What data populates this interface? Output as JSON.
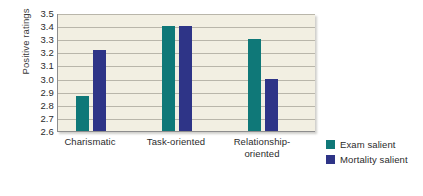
{
  "chart_data": {
    "type": "bar",
    "title": "",
    "xlabel": "",
    "ylabel": "Positive ratings",
    "ylim": [
      2.6,
      3.5
    ],
    "ytick_step": 0.1,
    "yticks": [
      "3.5",
      "3.4",
      "3.3",
      "3.2",
      "3.1",
      "3.0",
      "2.9",
      "2.8",
      "2.7",
      "2.6"
    ],
    "categories": [
      "Charismatic",
      "Task-oriented",
      "Relationship-oriented"
    ],
    "category_lines": [
      [
        "Charismatic"
      ],
      [
        "Task-oriented"
      ],
      [
        "Relationship-",
        "oriented"
      ]
    ],
    "series": [
      {
        "name": "Exam salient",
        "color": "#0f7878",
        "values": [
          2.87,
          3.4,
          3.3
        ]
      },
      {
        "name": "Mortality salient",
        "color": "#2e3487",
        "values": [
          3.22,
          3.4,
          3.0
        ]
      }
    ],
    "grid": true,
    "grid_axis": "y",
    "legend_position": "right-bottom",
    "plot_background": "#f2efe2",
    "grid_color": "#b9b6aa",
    "axis_color": "#8e8e8e",
    "figure_background": "#ffffff"
  }
}
